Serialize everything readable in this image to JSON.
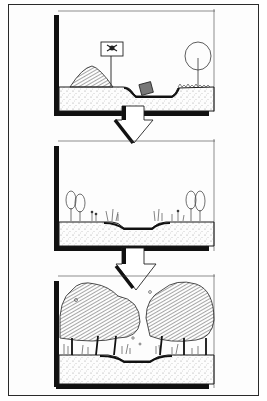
{
  "figure": {
    "type": "landscape restoration sequence sketch",
    "panels": [
      {
        "id": "stage-1",
        "label": "degraded site",
        "elements": [
          "spoil-mound",
          "warning-sign-skull",
          "dumped-barrel",
          "channel",
          "lone-tree-outline"
        ]
      },
      {
        "id": "stage-2",
        "label": "early revegetation",
        "elements": [
          "shrubs",
          "grasses",
          "shallow-channel"
        ]
      },
      {
        "id": "stage-3",
        "label": "mature woodland",
        "elements": [
          "dense-trees",
          "understory",
          "stream-channel"
        ]
      }
    ],
    "arrows": [
      "arrow-1-to-2",
      "arrow-2-to-3"
    ],
    "colors": {
      "ink": "#1a1a1a",
      "soil_stipple": "#9a9a9a",
      "paper": "#fdfdfd"
    }
  }
}
